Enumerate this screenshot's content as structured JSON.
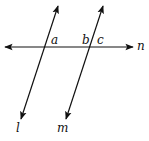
{
  "diagram": {
    "type": "geometry",
    "line_color": "#111111",
    "lines": [
      {
        "name": "n",
        "x1": 5,
        "y1": 47,
        "x2": 133,
        "y2": 47
      },
      {
        "name": "l",
        "x1": 58,
        "y1": 6,
        "x2": 21,
        "y2": 119
      },
      {
        "name": "m",
        "x1": 103,
        "y1": 6,
        "x2": 66,
        "y2": 119
      }
    ],
    "line_labels": {
      "n": "n",
      "l": "l",
      "m": "m"
    },
    "angle_labels": {
      "a": "a",
      "b": "b",
      "c": "c"
    }
  }
}
